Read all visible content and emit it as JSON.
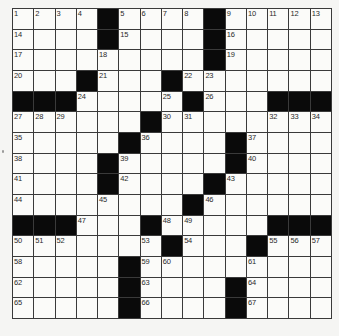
{
  "puzzle": {
    "size": {
      "rows": 15,
      "cols": 15
    },
    "colors": {
      "background": "#f5f5f3",
      "cell": "#fbfbf9",
      "block": "#0a0a0a",
      "gridline": "#3a3a3a",
      "number": "#2a2a2a"
    },
    "grid": [
      [
        "1",
        "2",
        "3",
        "4",
        "#",
        "5",
        "6",
        "7",
        "8",
        "#",
        "9",
        "10",
        "11",
        "12",
        "13"
      ],
      [
        "14",
        "",
        "",
        "",
        "#",
        "15",
        "",
        "",
        "",
        "#",
        "16",
        "",
        "",
        "",
        ""
      ],
      [
        "17",
        "",
        "",
        "",
        "18",
        "",
        "",
        "",
        "",
        "#",
        "19",
        "",
        "",
        "",
        ""
      ],
      [
        "20",
        "",
        "",
        "#",
        "21",
        "",
        "",
        "#",
        "22",
        "23",
        "",
        "",
        "",
        "",
        ""
      ],
      [
        "#",
        "#",
        "#",
        "24",
        "",
        "",
        "",
        "25",
        "#",
        "26",
        "",
        "",
        "#",
        "#",
        "#"
      ],
      [
        "27",
        "28",
        "29",
        "",
        "",
        "",
        "#",
        "30",
        "31",
        "",
        "",
        "",
        "32",
        "33",
        "34"
      ],
      [
        "35",
        "",
        "",
        "",
        "",
        "#",
        "36",
        "",
        "",
        "",
        "#",
        "37",
        "",
        "",
        ""
      ],
      [
        "38",
        "",
        "",
        "",
        "#",
        "39",
        "",
        "",
        "",
        "",
        "#",
        "40",
        "",
        "",
        ""
      ],
      [
        "41",
        "",
        "",
        "",
        "#",
        "42",
        "",
        "",
        "",
        "#",
        "43",
        "",
        "",
        "",
        ""
      ],
      [
        "44",
        "",
        "",
        "",
        "45",
        "",
        "",
        "",
        "#",
        "46",
        "",
        "",
        "",
        "",
        ""
      ],
      [
        "#",
        "#",
        "#",
        "47",
        "",
        "",
        "#",
        "48",
        "49",
        "",
        "",
        "",
        "#",
        "#",
        "#"
      ],
      [
        "50",
        "51",
        "52",
        "",
        "",
        "",
        "53",
        "#",
        "54",
        "",
        "",
        "#",
        "55",
        "56",
        "57"
      ],
      [
        "58",
        "",
        "",
        "",
        "",
        "#",
        "59",
        "60",
        "",
        "",
        "",
        "61",
        "",
        "",
        ""
      ],
      [
        "62",
        "",
        "",
        "",
        "",
        "#",
        "63",
        "",
        "",
        "",
        "#",
        "64",
        "",
        "",
        ""
      ],
      [
        "65",
        "",
        "",
        "",
        "",
        "#",
        "66",
        "",
        "",
        "",
        "#",
        "67",
        "",
        "",
        ""
      ]
    ]
  }
}
